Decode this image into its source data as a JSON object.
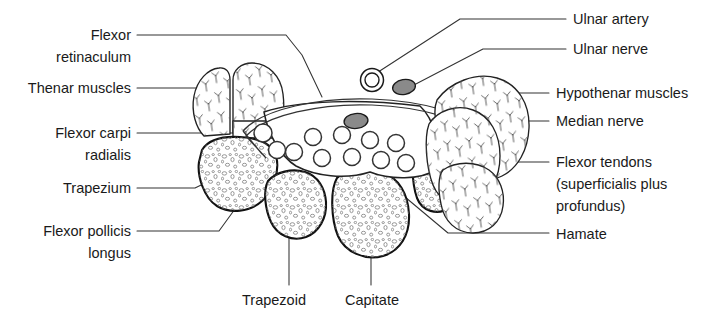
{
  "figure": {
    "background_color": "#ffffff",
    "line_color": "#333333",
    "nerve_fill_color": "#8a8a8a",
    "bone_fill_color": "#ffffff"
  },
  "labels": {
    "flexor_retinaculum_l1": "Flexor",
    "flexor_retinaculum_l2": "retinaculum",
    "thenar_muscles": "Thenar muscles",
    "flexor_carpi_radialis_l1": "Flexor carpi",
    "flexor_carpi_radialis_l2": "radialis",
    "trapezium": "Trapezium",
    "flexor_pollicis_longus_l1": "Flexor pollicis",
    "flexor_pollicis_longus_l2": "longus",
    "trapezoid": "Trapezoid",
    "capitate": "Capitate",
    "ulnar_artery": "Ulnar artery",
    "ulnar_nerve": "Ulnar nerve",
    "hypothenar_muscles": "Hypothenar muscles",
    "median_nerve": "Median nerve",
    "flexor_tendons_l1": "Flexor tendons",
    "flexor_tendons_l2": "(superficialis plus",
    "flexor_tendons_l3": "profundus)",
    "hamate": "Hamate"
  },
  "structures": {
    "bones": [
      "Trapezium",
      "Trapezoid",
      "Capitate",
      "Hamate"
    ],
    "muscles": [
      "Thenar muscles",
      "Hypothenar muscles"
    ],
    "nerves": [
      "Median nerve",
      "Ulnar nerve"
    ],
    "vessels": [
      "Ulnar artery"
    ],
    "tendons": [
      "Flexor tendons (superficialis plus profundus)",
      "Flexor carpi radialis",
      "Flexor pollicis longus"
    ],
    "bands": [
      "Flexor retinaculum"
    ],
    "tendon_circle_count": 9
  }
}
